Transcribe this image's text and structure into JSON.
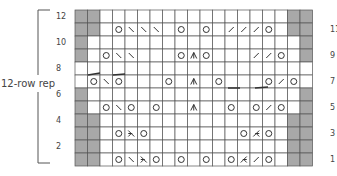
{
  "chart": {
    "title": "",
    "repeat_label": "12-row rep",
    "columns": 19,
    "rows": 12,
    "left_row_labels": [
      "12",
      "10",
      "8",
      "6",
      "4",
      "2"
    ],
    "right_row_labels": [
      "11",
      "9",
      "7",
      "5",
      "3",
      "1"
    ],
    "colors": {
      "grid": "#555555",
      "gray": "#a8a8a8",
      "symbol": "#333333"
    },
    "legend_symbols": {
      "O": "yarn-over",
      "\\": "ssk-left-slant-decrease",
      "/": "k2tog-right-slant-decrease",
      "A": "centered-double-decrease",
      "L": "left-leaning-double-decrease",
      "R": "right-leaning-double-decrease",
      "G": "no-stitch-gray"
    },
    "grid_rows": [
      {
        "row": 12,
        "cells": "GG...............GG"
      },
      {
        "row": 11,
        "cells": "GG.O\\\\\\.O.O./// O.GG"
      },
      {
        "row": 10,
        "cells": "G.................G"
      },
      {
        "row": 9,
        "cells": "G.O\\\\...OAO...//O.G"
      },
      {
        "row": 8,
        "cells": "..................."
      },
      {
        "row": 7,
        "cells": ".O\\O...O.A.O...O/O."
      },
      {
        "row": 6,
        "cells": "G.................G"
      },
      {
        "row": 5,
        "cells": "G.O\\O.O..A..O.O/O.G"
      },
      {
        "row": 4,
        "cells": "GG...............GG"
      },
      {
        "row": 3,
        "cells": "GG.OLO.......ORO.GG"
      },
      {
        "row": 2,
        "cells": "GG...............GG"
      },
      {
        "row": 1,
        "cells": "GG.O\\LO.O.O.OR/O.GG"
      }
    ]
  },
  "chart_data": {
    "type": "table",
    "annotation": "12-row rep",
    "row_labels_left": [
      12,
      10,
      8,
      6,
      4,
      2
    ],
    "row_labels_right": [
      11,
      9,
      7,
      5,
      3,
      1
    ],
    "columns": 19,
    "rows": [
      {
        "row": 12,
        "gray_cols": [
          1,
          2,
          18,
          19
        ],
        "symbols": []
      },
      {
        "row": 11,
        "gray_cols": [
          1,
          2,
          18,
          19
        ],
        "symbols": [
          [
            4,
            "yo"
          ],
          [
            5,
            "ssk"
          ],
          [
            6,
            "ssk"
          ],
          [
            7,
            "ssk"
          ],
          [
            9,
            "yo"
          ],
          [
            11,
            "yo"
          ],
          [
            13,
            "k2tog"
          ],
          [
            14,
            "k2tog"
          ],
          [
            15,
            "k2tog"
          ],
          [
            16,
            "yo"
          ]
        ]
      },
      {
        "row": 10,
        "gray_cols": [
          1,
          19
        ],
        "symbols": []
      },
      {
        "row": 9,
        "gray_cols": [
          1,
          19
        ],
        "symbols": [
          [
            3,
            "yo"
          ],
          [
            4,
            "ssk"
          ],
          [
            5,
            "ssk"
          ],
          [
            9,
            "yo"
          ],
          [
            10,
            "cdd"
          ],
          [
            11,
            "yo"
          ],
          [
            15,
            "k2tog"
          ],
          [
            16,
            "k2tog"
          ],
          [
            17,
            "yo"
          ]
        ]
      },
      {
        "row": 8,
        "gray_cols": [],
        "symbols": []
      },
      {
        "row": 7,
        "gray_cols": [],
        "symbols": [
          [
            2,
            "yo"
          ],
          [
            3,
            "ssk"
          ],
          [
            4,
            "yo"
          ],
          [
            8,
            "yo"
          ],
          [
            10,
            "cdd"
          ],
          [
            12,
            "yo"
          ],
          [
            16,
            "yo"
          ],
          [
            17,
            "k2tog"
          ],
          [
            18,
            "yo"
          ]
        ]
      },
      {
        "row": 6,
        "gray_cols": [
          1,
          19
        ],
        "symbols": []
      },
      {
        "row": 5,
        "gray_cols": [
          1,
          19
        ],
        "symbols": [
          [
            3,
            "yo"
          ],
          [
            4,
            "ssk"
          ],
          [
            5,
            "yo"
          ],
          [
            7,
            "yo"
          ],
          [
            10,
            "cdd"
          ],
          [
            13,
            "yo"
          ],
          [
            15,
            "yo"
          ],
          [
            16,
            "k2tog"
          ],
          [
            17,
            "yo"
          ]
        ]
      },
      {
        "row": 4,
        "gray_cols": [
          1,
          2,
          18,
          19
        ],
        "symbols": []
      },
      {
        "row": 3,
        "gray_cols": [
          1,
          2,
          18,
          19
        ],
        "symbols": [
          [
            4,
            "yo"
          ],
          [
            5,
            "sk2p"
          ],
          [
            6,
            "yo"
          ],
          [
            14,
            "yo"
          ],
          [
            15,
            "k3tog"
          ],
          [
            16,
            "yo"
          ]
        ]
      },
      {
        "row": 2,
        "gray_cols": [
          1,
          2,
          18,
          19
        ],
        "symbols": []
      },
      {
        "row": 1,
        "gray_cols": [
          1,
          2,
          18,
          19
        ],
        "symbols": [
          [
            4,
            "yo"
          ],
          [
            5,
            "ssk"
          ],
          [
            6,
            "sk2p"
          ],
          [
            7,
            "yo"
          ],
          [
            9,
            "yo"
          ],
          [
            11,
            "yo"
          ],
          [
            13,
            "yo"
          ],
          [
            14,
            "k3tog"
          ],
          [
            15,
            "k2tog"
          ],
          [
            16,
            "yo"
          ]
        ]
      }
    ]
  }
}
